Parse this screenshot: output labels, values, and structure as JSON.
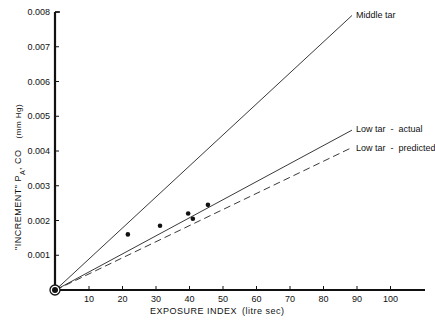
{
  "chart_data": {
    "type": "line",
    "title": "",
    "xlabel": "EXPOSURE INDEX   (litre sec)",
    "ylabel": "\"INCREMENT\" P_A, CO   (mm Hg)",
    "xlim": [
      0,
      110
    ],
    "ylim": [
      0,
      0.008
    ],
    "grid": false,
    "legend_position": "inline-right",
    "x_ticks": [
      10,
      20,
      30,
      40,
      50,
      60,
      70,
      80,
      90,
      100
    ],
    "x_tick_labels": [
      "10",
      "20",
      "30",
      "40",
      "50",
      "60",
      "70",
      "80",
      "90",
      "100"
    ],
    "y_ticks": [
      0.001,
      0.002,
      0.003,
      0.004,
      0.005,
      0.006,
      0.007,
      0.008
    ],
    "y_tick_labels": [
      "0.001",
      "0.002",
      "0.003",
      "0.004",
      "0.005",
      "0.006",
      "0.007",
      "0.008"
    ],
    "series": [
      {
        "name": "Middle tar",
        "style": "solid",
        "x": [
          0,
          88.5
        ],
        "values": [
          0,
          0.0079
        ]
      },
      {
        "name": "Low tar - actual",
        "style": "solid",
        "x": [
          0,
          88.5
        ],
        "values": [
          0,
          0.0046
        ]
      },
      {
        "name": "Low tar - predicted",
        "style": "dashed",
        "x": [
          0,
          88.5
        ],
        "values": [
          0,
          0.0041
        ]
      },
      {
        "name": "Observed (low tar)",
        "style": "points",
        "x": [
          21.6,
          31.2,
          39.6,
          41.0,
          45.5
        ],
        "values": [
          0.0016,
          0.00185,
          0.0022,
          0.00205,
          0.00245
        ]
      }
    ],
    "annotations": [
      "Middle tar",
      "Low tar - actual",
      "Low tar - predicted"
    ]
  },
  "labels": {
    "y_axis_title_main": "\"INCREMENT\" P",
    "y_axis_title_sub": "A",
    "y_axis_title_rest": ", CO",
    "y_axis_unit": "(mm Hg)",
    "x_axis_title": "EXPOSURE INDEX",
    "x_axis_unit": "(litre sec)",
    "series_middle": "Middle tar",
    "series_low_actual": "Low tar  -  actual",
    "series_low_predicted": "Low tar  -  predicted"
  }
}
